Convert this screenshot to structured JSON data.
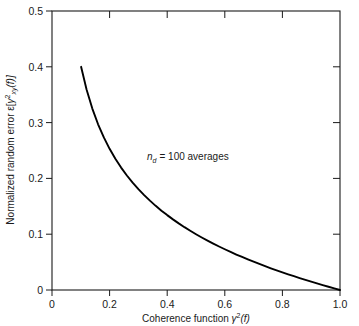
{
  "chart_data": {
    "type": "line",
    "title": "",
    "xlabel": "Coherence function γ²(f)",
    "ylabel": "Normalized random error ε[γ̂²xy(f)]",
    "xlim": [
      0,
      1.0
    ],
    "ylim": [
      0,
      0.5
    ],
    "grid": false,
    "legend_position": "none",
    "annotations": [
      {
        "text": "nd = 100 averages",
        "x": 0.33,
        "y": 0.245
      }
    ],
    "parameters": {
      "n_d": 100,
      "formula": "eps = sqrt(2)*(1 - g2) / (sqrt(g2) * sqrt(n_d))"
    },
    "xticks": [
      0,
      0.2,
      0.4,
      0.6,
      0.8,
      1.0
    ],
    "xticklabels": [
      "0",
      "0.2",
      "0.4",
      "0.6",
      "0.8",
      "1.0"
    ],
    "yticks": [
      0,
      0.1,
      0.2,
      0.3,
      0.4,
      0.5
    ],
    "yticklabels": [
      "0",
      "0.1",
      "0.2",
      "0.3",
      "0.4",
      "0.5"
    ],
    "series": [
      {
        "name": "n_d = 100",
        "color": "#000000",
        "x": [
          0.101,
          0.12,
          0.14,
          0.16,
          0.18,
          0.2,
          0.22,
          0.24,
          0.26,
          0.28,
          0.3,
          0.32,
          0.34,
          0.36,
          0.38,
          0.4,
          0.42,
          0.44,
          0.46,
          0.48,
          0.5,
          0.52,
          0.54,
          0.56,
          0.58,
          0.6,
          0.62,
          0.64,
          0.66,
          0.68,
          0.7,
          0.72,
          0.74,
          0.76,
          0.78,
          0.8,
          0.82,
          0.84,
          0.86,
          0.88,
          0.9,
          0.92,
          0.94,
          0.96,
          0.98,
          1.0
        ],
        "y": [
          0.4,
          0.3592,
          0.3251,
          0.297,
          0.2734,
          0.253,
          0.2351,
          0.2194,
          0.2052,
          0.1924,
          0.1807,
          0.17,
          0.1601,
          0.1508,
          0.1422,
          0.1342,
          0.1266,
          0.1194,
          0.1126,
          0.1062,
          0.1,
          0.0941,
          0.0885,
          0.0831,
          0.078,
          0.073,
          0.0682,
          0.0636,
          0.0592,
          0.0549,
          0.0507,
          0.0467,
          0.0428,
          0.0389,
          0.0352,
          0.0316,
          0.0281,
          0.0247,
          0.0214,
          0.0181,
          0.0149,
          0.0118,
          0.0087,
          0.0058,
          0.0029,
          0.0
        ]
      }
    ]
  },
  "labels": {
    "ylabel_prefix": "Normalized random error ",
    "ylabel_eps": "ε[",
    "ylabel_gamma": "γ",
    "ylabel_hat": "ˆ",
    "ylabel_sup": "2",
    "ylabel_sub": "xy",
    "ylabel_suffix": "(f)]",
    "xlabel_prefix": "Coherence function ",
    "xlabel_gamma": "γ",
    "xlabel_sup": "2",
    "xlabel_suffix": "(f)",
    "annot_n": "n",
    "annot_sub": "d",
    "annot_rest": "= 100 averages"
  }
}
